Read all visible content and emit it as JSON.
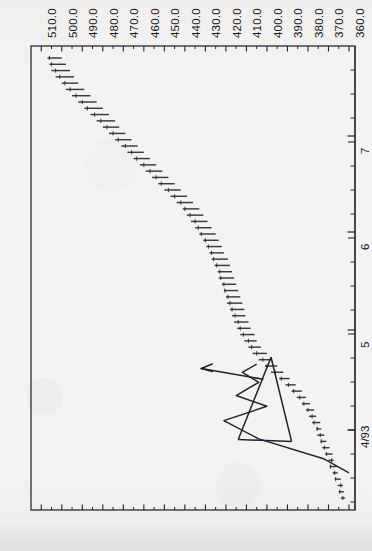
{
  "chart_data": {
    "type": "bar",
    "title": "",
    "subtitle": "",
    "orientation": "rotated-90",
    "xlabel": "",
    "ylabel": "",
    "price_axis": {
      "name": "price",
      "position": "top",
      "tick_labels": [
        "510.0",
        "500.0",
        "490.0",
        "480.0",
        "470.0",
        "460.0",
        "450.0",
        "440.0",
        "430.0",
        "420.0",
        "410.0",
        "400.0",
        "390.0",
        "380.0",
        "370.0",
        "360.0"
      ],
      "tick_values": [
        510,
        500,
        490,
        480,
        470,
        460,
        450,
        440,
        430,
        420,
        410,
        400,
        390,
        380,
        370,
        360
      ],
      "minor_ticks_between": 1,
      "range": [
        360,
        515
      ],
      "direction": "decreasing-left-to-right"
    },
    "time_axis": {
      "name": "date",
      "position": "right",
      "tick_labels": [
        "4/93",
        "5",
        "6",
        "7"
      ],
      "tick_positions_px": [
        430,
        330,
        232,
        136
      ],
      "minor_tick_spacing_px": 24,
      "direction": "bottom-to-top"
    },
    "grid": false,
    "legend": null,
    "series": [
      {
        "name": "price bars",
        "type": "hlc-bar",
        "note": "each bar drawn as horizontal segment; value = price low/high, t = date",
        "bars": [
          {
            "t": 0,
            "low": 362.0,
            "high": 364.0,
            "close": 363.0
          },
          {
            "t": 1,
            "low": 362.5,
            "high": 365.0,
            "close": 364.5
          },
          {
            "t": 2,
            "low": 363.0,
            "high": 365.5,
            "close": 364.0
          },
          {
            "t": 3,
            "low": 364.0,
            "high": 367.0,
            "close": 366.5
          },
          {
            "t": 4,
            "low": 365.5,
            "high": 368.0,
            "close": 367.0
          },
          {
            "t": 5,
            "low": 366.0,
            "high": 369.5,
            "close": 369.0
          },
          {
            "t": 6,
            "low": 367.5,
            "high": 370.0,
            "close": 368.5
          },
          {
            "t": 7,
            "low": 368.0,
            "high": 371.5,
            "close": 371.0
          },
          {
            "t": 8,
            "low": 369.5,
            "high": 373.0,
            "close": 372.0
          },
          {
            "t": 9,
            "low": 371.0,
            "high": 374.0,
            "close": 373.5
          },
          {
            "t": 10,
            "low": 372.0,
            "high": 375.5,
            "close": 374.0
          },
          {
            "t": 11,
            "low": 373.5,
            "high": 376.0,
            "close": 375.5
          },
          {
            "t": 12,
            "low": 374.0,
            "high": 378.0,
            "close": 377.0
          },
          {
            "t": 13,
            "low": 376.0,
            "high": 379.5,
            "close": 378.0
          },
          {
            "t": 14,
            "low": 377.0,
            "high": 381.0,
            "close": 380.0
          },
          {
            "t": 15,
            "low": 379.0,
            "high": 383.0,
            "close": 382.0
          },
          {
            "t": 16,
            "low": 381.0,
            "high": 385.5,
            "close": 384.0
          },
          {
            "t": 17,
            "low": 383.0,
            "high": 388.0,
            "close": 387.0
          },
          {
            "t": 18,
            "low": 386.0,
            "high": 391.0,
            "close": 389.5
          },
          {
            "t": 19,
            "low": 389.0,
            "high": 394.0,
            "close": 393.0
          },
          {
            "t": 20,
            "low": 392.0,
            "high": 398.0,
            "close": 396.0
          },
          {
            "t": 21,
            "low": 395.0,
            "high": 401.0,
            "close": 400.0
          },
          {
            "t": 22,
            "low": 398.0,
            "high": 404.0,
            "close": 402.0
          },
          {
            "t": 23,
            "low": 400.0,
            "high": 407.0,
            "close": 405.0
          },
          {
            "t": 24,
            "low": 403.0,
            "high": 409.0,
            "close": 407.5
          },
          {
            "t": 25,
            "low": 405.0,
            "high": 411.0,
            "close": 409.0
          },
          {
            "t": 26,
            "low": 406.0,
            "high": 413.0,
            "close": 411.5
          },
          {
            "t": 27,
            "low": 408.0,
            "high": 414.5,
            "close": 413.0
          },
          {
            "t": 28,
            "low": 409.0,
            "high": 416.0,
            "close": 414.0
          },
          {
            "t": 29,
            "low": 410.5,
            "high": 417.0,
            "close": 415.5
          },
          {
            "t": 30,
            "low": 411.0,
            "high": 418.0,
            "close": 417.0
          },
          {
            "t": 31,
            "low": 412.0,
            "high": 419.5,
            "close": 418.0
          },
          {
            "t": 32,
            "low": 413.0,
            "high": 420.0,
            "close": 419.0
          },
          {
            "t": 33,
            "low": 414.0,
            "high": 421.0,
            "close": 420.5
          },
          {
            "t": 34,
            "low": 415.0,
            "high": 422.0,
            "close": 421.0
          },
          {
            "t": 35,
            "low": 416.0,
            "high": 423.5,
            "close": 422.5
          },
          {
            "t": 36,
            "low": 417.0,
            "high": 424.0,
            "close": 423.0
          },
          {
            "t": 37,
            "low": 418.0,
            "high": 425.5,
            "close": 424.5
          },
          {
            "t": 38,
            "low": 419.0,
            "high": 427.0,
            "close": 426.0
          },
          {
            "t": 39,
            "low": 421.0,
            "high": 428.0,
            "close": 427.0
          },
          {
            "t": 40,
            "low": 422.0,
            "high": 429.5,
            "close": 428.5
          },
          {
            "t": 41,
            "low": 423.5,
            "high": 431.0,
            "close": 430.0
          },
          {
            "t": 42,
            "low": 425.0,
            "high": 433.0,
            "close": 432.0
          },
          {
            "t": 43,
            "low": 427.0,
            "high": 435.0,
            "close": 433.5
          },
          {
            "t": 44,
            "low": 429.0,
            "high": 437.0,
            "close": 435.0
          },
          {
            "t": 45,
            "low": 431.0,
            "high": 439.0,
            "close": 437.5
          },
          {
            "t": 46,
            "low": 433.0,
            "high": 441.0,
            "close": 440.0
          },
          {
            "t": 47,
            "low": 436.0,
            "high": 444.0,
            "close": 442.0
          },
          {
            "t": 48,
            "low": 439.0,
            "high": 447.0,
            "close": 445.0
          },
          {
            "t": 49,
            "low": 442.0,
            "high": 450.0,
            "close": 448.0
          },
          {
            "t": 50,
            "low": 445.0,
            "high": 453.0,
            "close": 451.5
          },
          {
            "t": 51,
            "low": 448.0,
            "high": 456.0,
            "close": 454.0
          },
          {
            "t": 52,
            "low": 451.0,
            "high": 459.0,
            "close": 457.0
          },
          {
            "t": 53,
            "low": 454.0,
            "high": 462.0,
            "close": 460.0
          },
          {
            "t": 54,
            "low": 457.0,
            "high": 465.0,
            "close": 463.5
          },
          {
            "t": 55,
            "low": 460.0,
            "high": 468.0,
            "close": 466.0
          },
          {
            "t": 56,
            "low": 463.0,
            "high": 471.0,
            "close": 469.0
          },
          {
            "t": 57,
            "low": 466.0,
            "high": 474.0,
            "close": 472.5
          },
          {
            "t": 58,
            "low": 469.0,
            "high": 477.0,
            "close": 475.0
          },
          {
            "t": 59,
            "low": 472.0,
            "high": 480.0,
            "close": 478.0
          },
          {
            "t": 60,
            "low": 474.0,
            "high": 483.0,
            "close": 481.0
          },
          {
            "t": 61,
            "low": 477.0,
            "high": 486.0,
            "close": 484.0
          },
          {
            "t": 62,
            "low": 480.0,
            "high": 489.0,
            "close": 487.5
          },
          {
            "t": 63,
            "low": 483.0,
            "high": 492.0,
            "close": 490.0
          },
          {
            "t": 64,
            "low": 486.0,
            "high": 495.0,
            "close": 493.0
          },
          {
            "t": 65,
            "low": 489.0,
            "high": 498.0,
            "close": 496.0
          },
          {
            "t": 66,
            "low": 492.0,
            "high": 500.0,
            "close": 498.5
          },
          {
            "t": 67,
            "low": 494.0,
            "high": 503.0,
            "close": 501.0
          },
          {
            "t": 68,
            "low": 496.0,
            "high": 505.0,
            "close": 503.0
          },
          {
            "t": 69,
            "low": 498.0,
            "high": 506.0,
            "close": 505.0
          },
          {
            "t": 70,
            "low": 500.0,
            "high": 507.0,
            "close": 506.0
          }
        ]
      }
    ],
    "annotations": [
      {
        "kind": "trendline-triangle",
        "label": "converging triangle / wedge pattern",
        "apex_price": 398.0
      },
      {
        "kind": "zigzag-trendlines",
        "label": "swing trendlines inside consolidation"
      },
      {
        "kind": "arrow",
        "label": "breakout direction",
        "points_toward": "higher price",
        "from_price": 402.0,
        "to_price": 432.0
      }
    ],
    "colors": {
      "ink": "#22222a",
      "ink_light": "#55555e",
      "background": "#f4f3f1",
      "frame": "#2b2b31"
    }
  }
}
